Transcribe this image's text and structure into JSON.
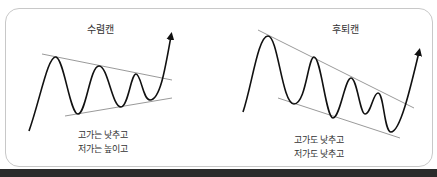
{
  "diagrams": [
    {
      "id": "symmetric-triangle",
      "title": "수렴캔",
      "caption_lines": [
        "고가는 낮추고",
        "저가는 높이고"
      ],
      "pattern": "converging",
      "line_color": "#999999",
      "curve_color": "#111111"
    },
    {
      "id": "descending-wedge",
      "title": "후퇴캔",
      "caption_lines": [
        "고가도 낮추고",
        "저가도 낮추고"
      ],
      "pattern": "descending",
      "line_color": "#999999",
      "curve_color": "#111111"
    }
  ]
}
